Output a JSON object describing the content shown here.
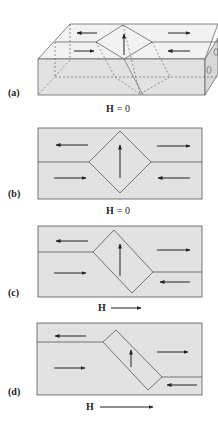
{
  "figure": {
    "colors": {
      "face": "#e2e2e2",
      "top_face": "#f2f2f2",
      "side_face": "#d8d8d8",
      "stroke": "#555555",
      "arrow": "#222222",
      "background": "#ffffff"
    },
    "panels": [
      {
        "id": "a",
        "label": "(a)",
        "field_label": "H = 0",
        "field_symbol": "H",
        "field_value": "= 0",
        "description": "3D slab with two domains separated by a domain wall, magnetization arrows left/right with an upward-pointing closure domain"
      },
      {
        "id": "b",
        "label": "(b)",
        "field_label": "H = 0",
        "field_symbol": "H",
        "field_value": "= 0",
        "description": "Symmetric diamond closure domain with upward arrow, top-left domain arrow left, bottom-left right, top-right right, bottom-right left"
      },
      {
        "id": "c",
        "label": "(c)",
        "field_label": "H →",
        "field_symbol": "H",
        "field_value": "→",
        "description": "Small applied field to the right; domain walls shift, diamond skews"
      },
      {
        "id": "d",
        "label": "(d)",
        "field_label": "H →",
        "field_symbol": "H",
        "field_value": "→",
        "description": "Larger applied field; closure domain becomes elongated tilted rectangle with short up arrow"
      }
    ]
  }
}
